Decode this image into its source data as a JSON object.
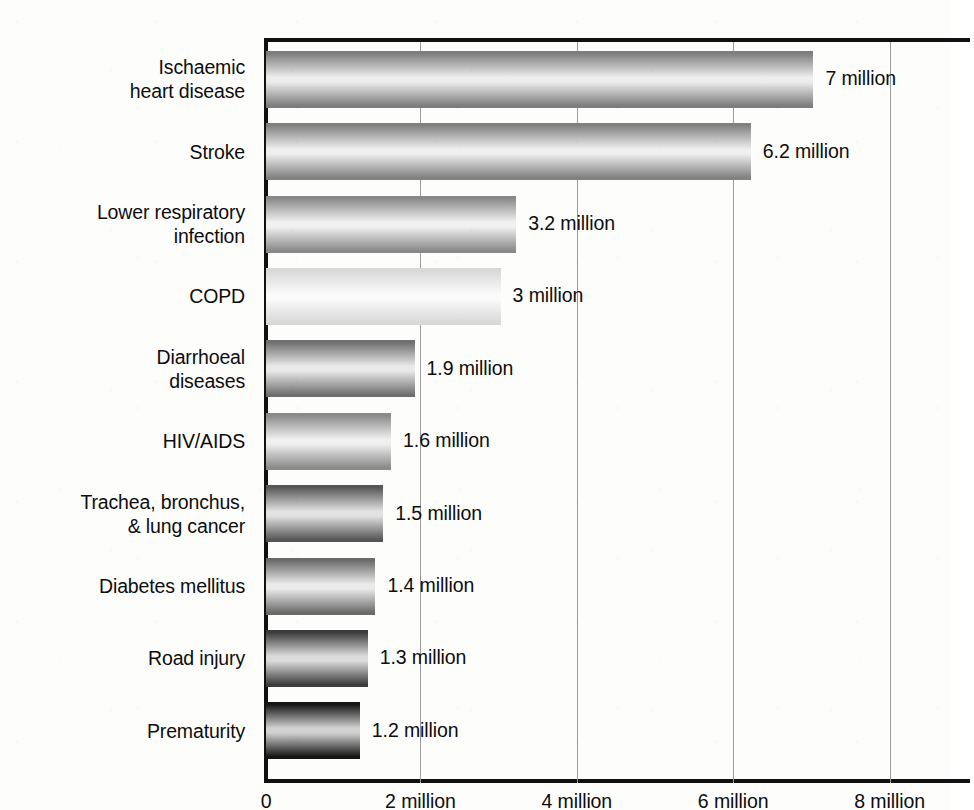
{
  "chart_data": {
    "type": "bar",
    "orientation": "horizontal",
    "title": "",
    "subtitle": "",
    "xlabel": "",
    "ylabel": "",
    "xlim": [
      0,
      8.95
    ],
    "grid": true,
    "legend": null,
    "units": "million deaths",
    "categories": [
      "Ischaemic\nheart disease",
      "Stroke",
      "Lower respiratory\ninfection",
      "COPD",
      "Diarrhoeal\ndiseases",
      "HIV/AIDS",
      "Trachea, bronchus,\n& lung cancer",
      "Diabetes mellitus",
      "Road injury",
      "Prematurity"
    ],
    "values": [
      7,
      6.2,
      3.2,
      3,
      1.9,
      1.6,
      1.5,
      1.4,
      1.3,
      1.2
    ],
    "value_labels": [
      "7 million",
      "6.2 million",
      "3.2 million",
      "3 million",
      "1.9 million",
      "1.6 million",
      "1.5 million",
      "1.4 million",
      "1.3 million",
      "1.2 million"
    ],
    "bar_shades": [
      {
        "edge": "#7d7d7d",
        "mid": "#ededed"
      },
      {
        "edge": "#818181",
        "mid": "#efefef"
      },
      {
        "edge": "#898989",
        "mid": "#f1f1f1"
      },
      {
        "edge": "#d8d8d8",
        "mid": "#fbfbfb"
      },
      {
        "edge": "#6f6f6f",
        "mid": "#e9e9e9"
      },
      {
        "edge": "#8a8a8a",
        "mid": "#f0f0f0"
      },
      {
        "edge": "#565656",
        "mid": "#e2e2e2"
      },
      {
        "edge": "#6a6a6a",
        "mid": "#ebebeb"
      },
      {
        "edge": "#3b3b3b",
        "mid": "#dcdcdc"
      },
      {
        "edge": "#151515",
        "mid": "#d2d2d2"
      }
    ],
    "xticks": [
      0,
      2,
      4,
      6,
      8
    ],
    "xtick_labels": [
      "0",
      "2 million",
      "4 million",
      "6 million",
      "8 million"
    ],
    "colors": {
      "axis": "#111111",
      "gridline": "#9b9b9b",
      "text": "#0d0d0d",
      "background": "#fdfdfc"
    }
  }
}
